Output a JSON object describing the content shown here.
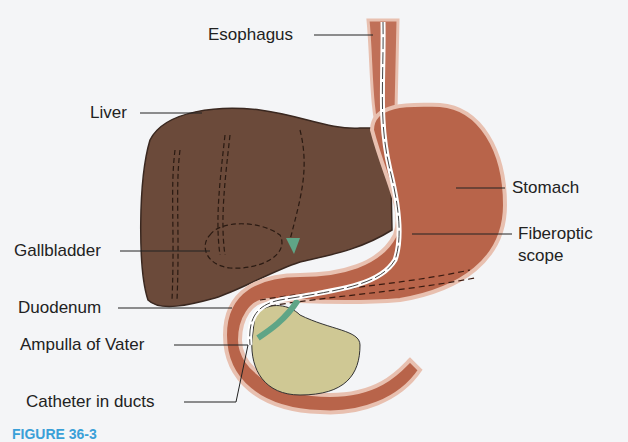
{
  "figure": {
    "labels": {
      "esophagus": "Esophagus",
      "liver": "Liver",
      "stomach": "Stomach",
      "gallbladder": "Gallbladder",
      "fiberoptic_scope_line1": "Fiberoptic",
      "fiberoptic_scope_line2": "scope",
      "duodenum": "Duodenum",
      "ampulla": "Ampulla of Vater",
      "catheter": "Catheter in ducts"
    },
    "caption_fragment": "FIGURE 36-3"
  },
  "colors": {
    "liver": "#6b4a3a",
    "stomach": "#b8644a",
    "stomach_wall": "#e8c0b0",
    "pancreas": "#cfc894",
    "bile_duct": "#6aa890",
    "scope": "#ffffff",
    "caption": "#3aa0d8"
  }
}
